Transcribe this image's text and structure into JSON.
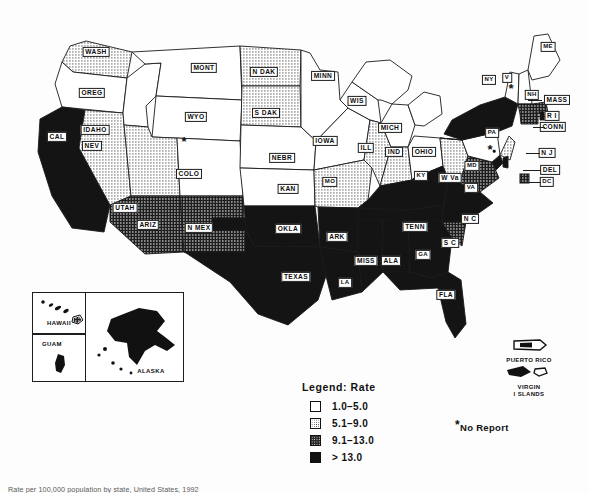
{
  "figure": {
    "type": "choropleth-map",
    "caption": "Rate per 100,000 population by state, United States, 1992"
  },
  "legend": {
    "title": "Legend:  Rate",
    "classes": [
      {
        "swatch": "white",
        "label": "1.0–5.0"
      },
      {
        "swatch": "light-stipple",
        "label": "5.1–9.0"
      },
      {
        "swatch": "dark-stipple",
        "label": "9.1–13.0"
      },
      {
        "swatch": "solid-black",
        "label": "> 13.0"
      }
    ]
  },
  "annotations": {
    "no_report_marker": "*",
    "no_report_label": "No Report"
  },
  "territories": [
    {
      "id": "puerto-rico",
      "label": "PUERTO RICO"
    },
    {
      "id": "virgin-islands",
      "label_line1": "VIRGIN",
      "label_line2": "I SLANDS"
    }
  ],
  "inset": {
    "hawaii": "HAWAII",
    "guam": "GUAM",
    "alaska": "ALASKA"
  },
  "states": [
    {
      "id": "WA",
      "label": "WASH",
      "class": 2,
      "x": 96,
      "y": 52
    },
    {
      "id": "OR",
      "label": "OREG",
      "class": 1,
      "x": 92,
      "y": 93
    },
    {
      "id": "CA",
      "label": "CAL",
      "class": 4,
      "x": 57,
      "y": 137
    },
    {
      "id": "NV",
      "label": "NEV",
      "class": 2,
      "x": 92,
      "y": 146
    },
    {
      "id": "ID",
      "label": "IDAHO",
      "class": 1,
      "x": 95,
      "y": 130
    },
    {
      "id": "MT",
      "label": "MONT",
      "class": 1,
      "x": 204,
      "y": 68
    },
    {
      "id": "WY",
      "label": "WYO",
      "class": 1,
      "x": 196,
      "y": 117
    },
    {
      "id": "UT",
      "label": "UTAH",
      "class": 2,
      "x": 125,
      "y": 208
    },
    {
      "id": "CO",
      "label": "COLO",
      "class": 1,
      "x": 189,
      "y": 174
    },
    {
      "id": "AZ",
      "label": "ARIZ",
      "class": 3,
      "x": 148,
      "y": 225
    },
    {
      "id": "NM",
      "label": "N MEX",
      "class": 3,
      "x": 199,
      "y": 228
    },
    {
      "id": "ND",
      "label": "N DAK",
      "class": 2,
      "x": 264,
      "y": 72
    },
    {
      "id": "SD",
      "label": "S DAK",
      "class": 2,
      "x": 266,
      "y": 113
    },
    {
      "id": "NE",
      "label": "NEBR",
      "class": 1,
      "x": 282,
      "y": 158
    },
    {
      "id": "KS",
      "label": "KAN",
      "class": 1,
      "x": 288,
      "y": 189
    },
    {
      "id": "OK",
      "label": "OKLA",
      "class": 4,
      "x": 288,
      "y": 229
    },
    {
      "id": "TX",
      "label": "TEXAS",
      "class": 4,
      "x": 296,
      "y": 277
    },
    {
      "id": "MN",
      "label": "MINN",
      "class": 1,
      "x": 323,
      "y": 76
    },
    {
      "id": "IA",
      "label": "IOWA",
      "class": 1,
      "x": 325,
      "y": 141
    },
    {
      "id": "MO",
      "label": "MO",
      "class": 2,
      "x": 330,
      "y": 182
    },
    {
      "id": "AR",
      "label": "ARK",
      "class": 4,
      "x": 337,
      "y": 237
    },
    {
      "id": "LA",
      "label": "LA",
      "class": 4,
      "x": 345,
      "y": 283
    },
    {
      "id": "WI",
      "label": "WIS",
      "class": 1,
      "x": 357,
      "y": 101
    },
    {
      "id": "IL",
      "label": "ILL",
      "class": 2,
      "x": 366,
      "y": 148
    },
    {
      "id": "MS",
      "label": "MISS",
      "class": 4,
      "x": 366,
      "y": 261
    },
    {
      "id": "MI",
      "label": "MICH",
      "class": 1,
      "x": 390,
      "y": 128
    },
    {
      "id": "IN",
      "label": "IND",
      "class": 2,
      "x": 394,
      "y": 152
    },
    {
      "id": "AL",
      "label": "ALA",
      "class": 4,
      "x": 391,
      "y": 261
    },
    {
      "id": "KY",
      "label": "KY",
      "class": 4,
      "x": 421,
      "y": 176
    },
    {
      "id": "OH",
      "label": "OHIO",
      "class": 1,
      "x": 424,
      "y": 152
    },
    {
      "id": "TN",
      "label": "TENN",
      "class": 4,
      "x": 415,
      "y": 227
    },
    {
      "id": "GA",
      "label": "GA",
      "class": 4,
      "x": 423,
      "y": 255
    },
    {
      "id": "FL",
      "label": "FLA",
      "class": 4,
      "x": 446,
      "y": 295
    },
    {
      "id": "WV",
      "label": "W Va",
      "class": 2,
      "x": 450,
      "y": 178
    },
    {
      "id": "SC",
      "label": "S C",
      "class": 3,
      "x": 450,
      "y": 243
    },
    {
      "id": "NC",
      "label": "N C",
      "class": 4,
      "x": 470,
      "y": 219
    },
    {
      "id": "VA",
      "label": "VA",
      "class": 3,
      "x": 471,
      "y": 188
    },
    {
      "id": "MD",
      "label": "MD",
      "class": 4,
      "x": 472,
      "y": 166
    },
    {
      "id": "PA",
      "label": "PA",
      "class": 1,
      "x": 492,
      "y": 133
    },
    {
      "id": "NY",
      "label": "NY",
      "class": 4,
      "x": 489,
      "y": 80
    },
    {
      "id": "VT",
      "label": "V",
      "class": 1,
      "x": 507,
      "y": 78
    },
    {
      "id": "NH",
      "label": "NH",
      "class": 1,
      "x": 532,
      "y": 95
    },
    {
      "id": "ME",
      "label": "ME",
      "class": 1,
      "x": 548,
      "y": 47
    },
    {
      "id": "MA",
      "label": "MASS",
      "class": 3,
      "x": 557,
      "y": 100
    },
    {
      "id": "RI",
      "label": "R I",
      "class": 4,
      "x": 552,
      "y": 116
    },
    {
      "id": "CT",
      "label": "CONN",
      "class": 3,
      "x": 553,
      "y": 127
    },
    {
      "id": "NJ",
      "label": "N J",
      "class": 2,
      "x": 547,
      "y": 153
    },
    {
      "id": "DE",
      "label": "DEL",
      "class": 4,
      "x": 550,
      "y": 170
    },
    {
      "id": "DC",
      "label": "DC",
      "class": 3,
      "x": 547,
      "y": 182
    }
  ],
  "no_report_states": [
    {
      "id": "WY",
      "x": 184,
      "y": 142
    },
    {
      "id": "VT",
      "x": 511,
      "y": 89
    },
    {
      "id": "PA",
      "x": 490,
      "y": 150
    }
  ]
}
